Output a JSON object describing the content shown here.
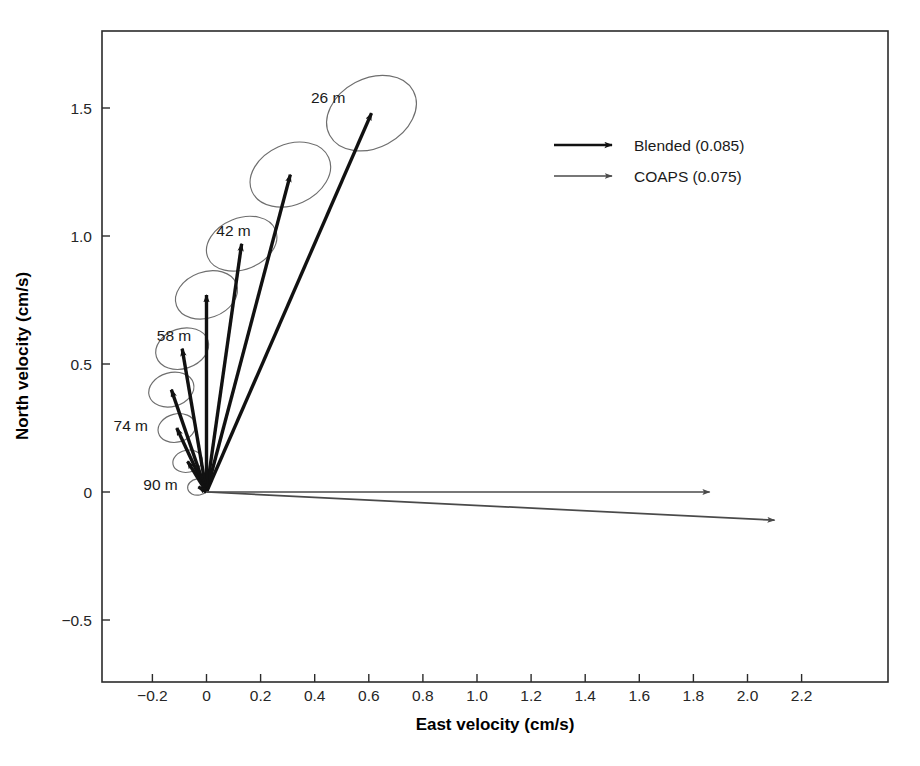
{
  "chart_data": {
    "type": "scatter",
    "title": "",
    "subtitle": "",
    "xlabel": "East velocity (cm/s)",
    "ylabel": "North velocity (cm/s)",
    "xlim": [
      -0.31,
      2.38
    ],
    "ylim": [
      -0.67,
      1.78
    ],
    "xticks": [
      -0.2,
      0,
      0.2,
      0.4,
      0.6,
      0.8,
      1.0,
      1.2,
      1.4,
      1.6,
      1.8,
      2.0,
      2.2
    ],
    "xticklabels": [
      "−0.2",
      "0",
      "0.2",
      "0.4",
      "0.6",
      "0.8",
      "1.0",
      "1.2",
      "1.4",
      "1.6",
      "1.8",
      "2.0",
      "2.2"
    ],
    "yticks": [
      -0.5,
      0,
      0.5,
      1.0,
      1.5
    ],
    "yticklabels": [
      "−0.5",
      "0",
      "0.5",
      "1.0",
      "1.5"
    ],
    "grid": false,
    "legend_position": "upper-right",
    "origin": [
      0,
      0
    ],
    "series": [
      {
        "name": "Blended (0.085)",
        "color": "#111111",
        "style": "thick-arrow",
        "vectors": [
          {
            "label": "26 m",
            "u": 0.61,
            "v": 1.48,
            "show_label": true,
            "ellipse": {
              "rx": 0.175,
              "ry": 0.135,
              "angle": -28
            }
          },
          {
            "label": "34 m",
            "u": 0.31,
            "v": 1.24,
            "show_label": false,
            "ellipse": {
              "rx": 0.155,
              "ry": 0.118,
              "angle": -24
            }
          },
          {
            "label": "42 m",
            "u": 0.13,
            "v": 0.97,
            "show_label": true,
            "ellipse": {
              "rx": 0.135,
              "ry": 0.1,
              "angle": -22
            }
          },
          {
            "label": "50 m",
            "u": 0.0,
            "v": 0.77,
            "show_label": false,
            "ellipse": {
              "rx": 0.118,
              "ry": 0.09,
              "angle": -20
            }
          },
          {
            "label": "58 m",
            "u": -0.09,
            "v": 0.56,
            "show_label": true,
            "ellipse": {
              "rx": 0.1,
              "ry": 0.078,
              "angle": -18
            }
          },
          {
            "label": "66 m",
            "u": -0.13,
            "v": 0.4,
            "show_label": false,
            "ellipse": {
              "rx": 0.085,
              "ry": 0.066,
              "angle": -16
            }
          },
          {
            "label": "74 m",
            "u": -0.11,
            "v": 0.25,
            "show_label": true,
            "ellipse": {
              "rx": 0.07,
              "ry": 0.055,
              "angle": -14
            }
          },
          {
            "label": "82 m",
            "u": -0.07,
            "v": 0.12,
            "show_label": false,
            "ellipse": {
              "rx": 0.055,
              "ry": 0.043,
              "angle": -12
            }
          },
          {
            "label": "90 m",
            "u": -0.03,
            "v": 0.02,
            "show_label": true,
            "ellipse": {
              "rx": 0.04,
              "ry": 0.032,
              "angle": -10
            }
          }
        ]
      },
      {
        "name": "COAPS (0.075)",
        "color": "#4a4a4a",
        "style": "thin-arrow",
        "vectors": [
          {
            "label": "",
            "u": 1.86,
            "v": 0.0,
            "show_label": false,
            "ellipse": null
          },
          {
            "label": "",
            "u": 2.1,
            "v": -0.11,
            "show_label": false,
            "ellipse": null
          }
        ]
      }
    ],
    "depth_labels": [
      {
        "text": "26 m",
        "x": 0.45,
        "y": 1.54,
        "anchor": "middle"
      },
      {
        "text": "42 m",
        "x": 0.1,
        "y": 1.02,
        "anchor": "middle"
      },
      {
        "text": "58 m",
        "x": -0.12,
        "y": 0.61,
        "anchor": "middle"
      },
      {
        "text": "74 m",
        "x": -0.28,
        "y": 0.26,
        "anchor": "middle"
      },
      {
        "text": "90 m",
        "x": -0.17,
        "y": 0.03,
        "anchor": "middle"
      }
    ],
    "legend": {
      "entries": [
        {
          "label": "Blended (0.085)",
          "color": "#111111",
          "weight": "thick"
        },
        {
          "label": "COAPS (0.075)",
          "color": "#4a4a4a",
          "weight": "thin"
        }
      ]
    },
    "colors": {
      "blended": "#111111",
      "coaps": "#4a4a4a",
      "ellipse": "#6e6e6e",
      "axis": "#2b2b2b",
      "background": "#ffffff"
    }
  }
}
